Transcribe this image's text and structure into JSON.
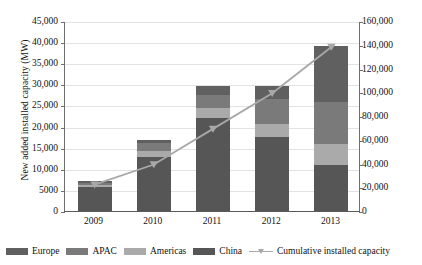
{
  "chart_data": {
    "type": "bar",
    "title": "",
    "xlabel": "",
    "ylabel": "New added installed capacity (MW)",
    "y2label": "Cumulative installed capacity (MW)",
    "categories": [
      "2009",
      "2010",
      "2011",
      "2012",
      "2013"
    ],
    "ylim": [
      0,
      45000
    ],
    "y2lim": [
      0,
      160000
    ],
    "yticks": [
      "0",
      "5000",
      "10,000",
      "15,000",
      "20,000",
      "25,000",
      "30,000",
      "35,000",
      "40,000",
      "45,000"
    ],
    "ytick_values": [
      0,
      5000,
      10000,
      15000,
      20000,
      25000,
      30000,
      35000,
      40000,
      45000
    ],
    "y2ticks": [
      "0",
      "20,000",
      "40,000",
      "60,000",
      "80,000",
      "100,000",
      "120,000",
      "140,000",
      "160,000"
    ],
    "y2tick_values": [
      0,
      20000,
      40000,
      60000,
      80000,
      100000,
      120000,
      140000,
      160000
    ],
    "grid": true,
    "stacked": true,
    "legend_position": "bottom",
    "series": [
      {
        "name": "China",
        "color": "#565656",
        "axis": "left",
        "values": [
          5800,
          12900,
          22100,
          17500,
          10800
        ]
      },
      {
        "name": "Americas",
        "color": "#aaaaaa",
        "axis": "left",
        "values": [
          380,
          1400,
          2400,
          3100,
          5100
        ]
      },
      {
        "name": "APAC",
        "color": "#7a7a7a",
        "axis": "left",
        "values": [
          560,
          1700,
          3100,
          5900,
          9900
        ]
      },
      {
        "name": "Europe",
        "color": "#606060",
        "axis": "left",
        "values": [
          400,
          800,
          1900,
          3100,
          13200
        ]
      }
    ],
    "stack_order": [
      "China",
      "Americas",
      "APAC",
      "Europe"
    ],
    "bar_totals": [
      7140,
      16800,
      29500,
      29600,
      39000
    ],
    "line_series": {
      "name": "Cumulative installed capacity",
      "color": "#a8a8a8",
      "marker": "triangle",
      "axis": "right",
      "values": [
        23000,
        40000,
        70000,
        100000,
        139000
      ]
    }
  },
  "legend": {
    "items": [
      {
        "label": "Europe",
        "color": "#606060",
        "kind": "swatch"
      },
      {
        "label": "APAC",
        "color": "#7a7a7a",
        "kind": "swatch"
      },
      {
        "label": "Americas",
        "color": "#aaaaaa",
        "kind": "swatch"
      },
      {
        "label": "China",
        "color": "#565656",
        "kind": "swatch"
      },
      {
        "label": "Cumulative installed capacity",
        "color": "#a8a8a8",
        "kind": "line"
      }
    ]
  }
}
